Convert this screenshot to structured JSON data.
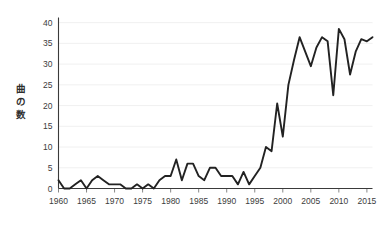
{
  "chart_data": {
    "type": "line",
    "title": "",
    "subtitle": "",
    "xlabel": "",
    "ylabel": "曲の数",
    "ylabel_chars": [
      "曲",
      "の",
      "数"
    ],
    "xlim": [
      1960,
      2016
    ],
    "ylim": [
      0,
      41
    ],
    "grid": true,
    "grid_axis": "y",
    "legend": false,
    "legend_position": "none",
    "line_color": "#222222",
    "grid_color": "#ececec",
    "axis_color": "#3a3a3a",
    "background_color": "#ffffff",
    "y_ticks": [
      0,
      5,
      10,
      15,
      20,
      25,
      30,
      35,
      40
    ],
    "y_tick_labels": [
      "0",
      "5",
      "10",
      "15",
      "20",
      "25",
      "30",
      "35",
      "40"
    ],
    "x_ticks": [
      1960,
      1965,
      1970,
      1975,
      1980,
      1985,
      1990,
      1995,
      2000,
      2005,
      2010,
      2015
    ],
    "x_tick_labels": [
      "1960",
      "1965",
      "1970",
      "1975",
      "1980",
      "1985",
      "1990",
      "1995",
      "2000",
      "2005",
      "2010",
      "2015"
    ],
    "x": [
      1960,
      1961,
      1962,
      1963,
      1964,
      1965,
      1966,
      1967,
      1968,
      1969,
      1970,
      1971,
      1972,
      1973,
      1974,
      1975,
      1976,
      1977,
      1978,
      1979,
      1980,
      1981,
      1982,
      1983,
      1984,
      1985,
      1986,
      1987,
      1988,
      1989,
      1990,
      1991,
      1992,
      1993,
      1994,
      1995,
      1996,
      1997,
      1998,
      1999,
      2000,
      2001,
      2002,
      2003,
      2004,
      2005,
      2006,
      2007,
      2008,
      2009,
      2010,
      2011,
      2012,
      2013,
      2014,
      2015,
      2016
    ],
    "values": [
      2,
      0,
      0,
      1,
      2,
      0,
      2,
      3,
      2,
      1,
      1,
      1,
      0,
      0,
      1,
      0,
      1,
      0,
      2,
      3,
      3,
      7,
      2,
      6,
      6,
      3,
      2,
      5,
      5,
      3,
      3,
      3,
      1,
      4,
      1,
      3,
      5,
      10,
      9,
      20.5,
      12.5,
      25,
      31,
      36.5,
      33,
      29.5,
      34,
      36.5,
      35.5,
      22.5,
      38.5,
      36,
      27.5,
      33,
      36,
      35.5,
      36.5
    ],
    "series": [
      {
        "name": "曲の数",
        "values": [
          2,
          0,
          0,
          1,
          2,
          0,
          2,
          3,
          2,
          1,
          1,
          1,
          0,
          0,
          1,
          0,
          1,
          0,
          2,
          3,
          3,
          7,
          2,
          6,
          6,
          3,
          2,
          5,
          5,
          3,
          3,
          3,
          1,
          4,
          1,
          3,
          5,
          10,
          9,
          20.5,
          12.5,
          25,
          31,
          36.5,
          33,
          29.5,
          34,
          36.5,
          35.5,
          22.5,
          38.5,
          36,
          27.5,
          33,
          36,
          35.5,
          36.5
        ]
      }
    ],
    "annotations": []
  }
}
